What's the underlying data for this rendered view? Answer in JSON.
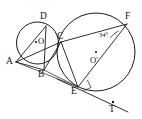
{
  "figure": {
    "type": "geometry-diagram",
    "background_color": "#ffffff",
    "stroke_color": "#1a1a1a",
    "width": 142,
    "height": 119,
    "points": [
      {
        "id": "A",
        "label": "A",
        "x": 16,
        "y": 62,
        "label_x": 7,
        "label_y": 58
      },
      {
        "id": "B",
        "label": "B",
        "x": 44,
        "y": 70,
        "label_x": 39,
        "label_y": 70
      },
      {
        "id": "C",
        "label": "C",
        "x": 61,
        "y": 42,
        "label_x": 57,
        "label_y": 33
      },
      {
        "id": "D",
        "label": "D",
        "x": 46,
        "y": 26,
        "label_x": 41,
        "label_y": 13
      },
      {
        "id": "E",
        "label": "E",
        "x": 78,
        "y": 87,
        "label_x": 72,
        "label_y": 88
      },
      {
        "id": "F",
        "label": "F",
        "x": 127,
        "y": 24,
        "label_x": 126,
        "label_y": 13
      },
      {
        "id": "T",
        "label": "T",
        "x": 113,
        "y": 103,
        "label_x": 110,
        "label_y": 105
      },
      {
        "id": "O",
        "label": "O",
        "x": 37,
        "y": 43,
        "label_x": 38,
        "label_y": 38
      },
      {
        "id": "Op",
        "label": "O'",
        "x": 96,
        "y": 55,
        "label_x": 91,
        "label_y": 57
      }
    ],
    "circles": [
      {
        "id": "small-circle",
        "center": "O",
        "cx": 37.5,
        "cy": 43.0,
        "r": 21.0
      },
      {
        "id": "large-circle",
        "center": "Op",
        "cx": 96.0,
        "cy": 52.0,
        "r": 39.0
      }
    ],
    "segments": [
      {
        "id": "chord-A-D",
        "from": "A",
        "to": "D"
      },
      {
        "id": "chord-A-C",
        "from": "A",
        "to": "C"
      },
      {
        "id": "chord-A-B",
        "from": "A",
        "to": "B"
      },
      {
        "id": "chord-D-B",
        "from": "D",
        "to": "B"
      },
      {
        "id": "chord-B-C",
        "from": "B",
        "to": "C"
      },
      {
        "id": "chord-C-F",
        "from": "C",
        "to": "F"
      },
      {
        "id": "chord-F-E",
        "from": "F",
        "to": "E"
      },
      {
        "id": "chord-C-E",
        "from": "C",
        "to": "E"
      },
      {
        "id": "segment-B-E",
        "from": "B",
        "to": "E"
      },
      {
        "id": "segment-A-E",
        "from": "A",
        "to": "E"
      },
      {
        "id": "tangent-E-T",
        "from": "E",
        "to": "T"
      }
    ],
    "angles": [
      {
        "id": "angle-at-F",
        "value": "34°",
        "vertex": "F",
        "label_x": 100,
        "label_y": 33
      }
    ],
    "marks": [
      {
        "id": "right-angle-mark-at-E",
        "at": "E",
        "type": "right-angle"
      },
      {
        "id": "tangent-point-dot",
        "at": "T",
        "type": "dot"
      },
      {
        "id": "center-dot-O",
        "at": "O",
        "type": "dot"
      },
      {
        "id": "center-dot-Op",
        "at": "Op",
        "type": "dot"
      }
    ]
  }
}
